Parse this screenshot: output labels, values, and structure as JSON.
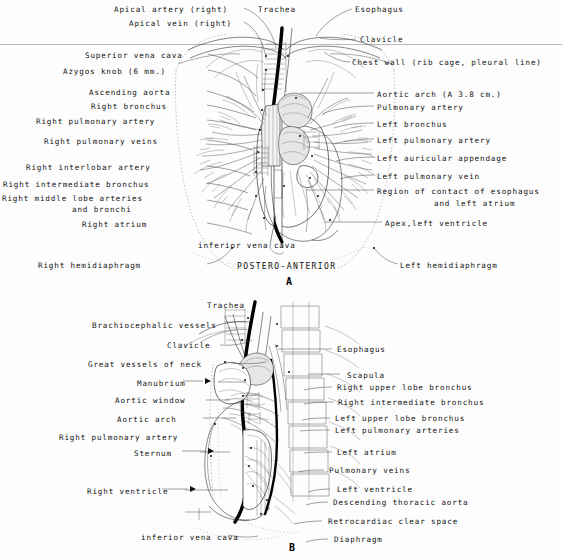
{
  "figure": {
    "title_implicit": "Chest radiograph anatomy diagrams",
    "divider_color": "#b9b9b9"
  },
  "panel_a": {
    "letter": "A",
    "caption": "POSTERO-ANTERIOR",
    "labels_left": [
      {
        "text": "Apical artery (right)",
        "x": 114,
        "y": 5
      },
      {
        "text": "Apical vein (right)",
        "x": 129,
        "y": 19
      },
      {
        "text": "Superior vena cava",
        "x": 85,
        "y": 51
      },
      {
        "text": "Azygos knob (6 mm.)",
        "x": 63,
        "y": 67
      },
      {
        "text": "Ascending aorta",
        "x": 89,
        "y": 88
      },
      {
        "text": "Right bronchus",
        "x": 91,
        "y": 102
      },
      {
        "text": "Right pulmonary artery",
        "x": 36,
        "y": 117
      },
      {
        "text": "Right pulmonary veins",
        "x": 44,
        "y": 137
      },
      {
        "text": "Right interlobar artery",
        "x": 26,
        "y": 163
      },
      {
        "text": "Right intermediate bronchus",
        "x": 4,
        "y": 180
      },
      {
        "text": "Right middle lobe arteries",
        "x": 3,
        "y": 194
      },
      {
        "text": "and bronchi",
        "x": 72,
        "y": 205
      },
      {
        "text": "Right atrium",
        "x": 82,
        "y": 220
      },
      {
        "text": "Right hemidiaphragm",
        "x": 38,
        "y": 261
      }
    ],
    "labels_right": [
      {
        "text": "Esophagus",
        "x": 355,
        "y": 5
      },
      {
        "text": "Clavicle",
        "x": 360,
        "y": 35
      },
      {
        "text": "Chest wall (rib cage, pleural line)",
        "x": 352,
        "y": 58
      },
      {
        "text": "Aortic arch (A 3.8 cm.)",
        "x": 377,
        "y": 90
      },
      {
        "text": "Pulmonary artery",
        "x": 377,
        "y": 103
      },
      {
        "text": "Left bronchus",
        "x": 377,
        "y": 120
      },
      {
        "text": "Left pulmonary artery",
        "x": 377,
        "y": 136
      },
      {
        "text": "Left auricular appendage",
        "x": 377,
        "y": 154
      },
      {
        "text": "Left pulmonary vein",
        "x": 377,
        "y": 172
      },
      {
        "text": "Region of contact of esophagus",
        "x": 377,
        "y": 187
      },
      {
        "text": "and left atrium",
        "x": 434,
        "y": 199
      },
      {
        "text": "Apex,left ventricle",
        "x": 385,
        "y": 219
      },
      {
        "text": "Left hemidiaphragm",
        "x": 400,
        "y": 261
      }
    ],
    "labels_inner": [
      {
        "text": "Trachea",
        "x": 258,
        "y": 5
      },
      {
        "text": "inferior vena cava",
        "x": 198,
        "y": 241
      }
    ]
  },
  "panel_b": {
    "letter": "B",
    "labels_left": [
      {
        "text": "Trachea",
        "x": 207,
        "y": 301
      },
      {
        "text": "Brachiocephalic vessels",
        "x": 92,
        "y": 321
      },
      {
        "text": "Clavicle",
        "x": 167,
        "y": 341
      },
      {
        "text": "Great vessels of neck",
        "x": 88,
        "y": 360
      },
      {
        "text": "Manubrium",
        "x": 137,
        "y": 379
      },
      {
        "text": "Aortic window",
        "x": 115,
        "y": 396
      },
      {
        "text": "Aortic arch",
        "x": 117,
        "y": 415
      },
      {
        "text": "Right pulmonary artery",
        "x": 59,
        "y": 433
      },
      {
        "text": "Sternum",
        "x": 134,
        "y": 449
      },
      {
        "text": "Right ventricle",
        "x": 87,
        "y": 487
      },
      {
        "text": "inferior vena cava",
        "x": 141,
        "y": 533
      }
    ],
    "labels_right": [
      {
        "text": "Esophagus",
        "x": 337,
        "y": 345
      },
      {
        "text": "Scapula",
        "x": 347,
        "y": 371
      },
      {
        "text": "Right upper lobe bronchus",
        "x": 337,
        "y": 383
      },
      {
        "text": "Right intermediate bronchus",
        "x": 338,
        "y": 398
      },
      {
        "text": "Left upper lobe bronchus",
        "x": 335,
        "y": 414
      },
      {
        "text": "Left pulmonary arteries",
        "x": 335,
        "y": 426
      },
      {
        "text": "Left atrium",
        "x": 337,
        "y": 448
      },
      {
        "text": "Pulmonary veins",
        "x": 329,
        "y": 466
      },
      {
        "text": "Left ventricle",
        "x": 337,
        "y": 485
      },
      {
        "text": "Descending thoracic aorta",
        "x": 333,
        "y": 498
      },
      {
        "text": "Retrocardiac clear space",
        "x": 328,
        "y": 517
      },
      {
        "text": "Diaphragm",
        "x": 334,
        "y": 535
      }
    ]
  },
  "colors": {
    "ink": "#111111",
    "line": "#222222",
    "faint": "#888888",
    "background": "#fdfdfd"
  }
}
